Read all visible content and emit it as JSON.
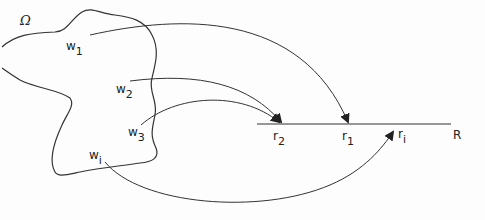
{
  "diagram": {
    "domain_label": "Ω",
    "range_label": "R",
    "domain_points": [
      {
        "base": "w",
        "sub": "1"
      },
      {
        "base": "w",
        "sub": "2"
      },
      {
        "base": "w",
        "sub": "3"
      },
      {
        "base": "w",
        "sub": "i"
      }
    ],
    "range_points": [
      {
        "base": "r",
        "sub": "2"
      },
      {
        "base": "r",
        "sub": "1"
      },
      {
        "base": "r",
        "sub": "i"
      }
    ],
    "mappings": [
      {
        "from": "w1",
        "to": "r1"
      },
      {
        "from": "w2",
        "to": "r2"
      },
      {
        "from": "w3",
        "to": "r2"
      },
      {
        "from": "wi",
        "to": "ri"
      }
    ],
    "colors": {
      "stroke": "#333333",
      "background": "#fdfdfd"
    }
  }
}
